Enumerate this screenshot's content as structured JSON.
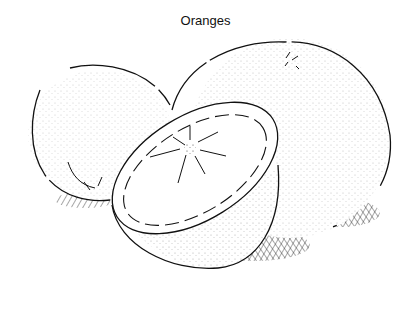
{
  "title": "Oranges",
  "illustration": {
    "subject": "two whole oranges and one halved orange",
    "style": "black line drawing with stippling and cross-hatched shadows",
    "colors": {
      "ink": "#111111",
      "background": "#ffffff"
    }
  }
}
